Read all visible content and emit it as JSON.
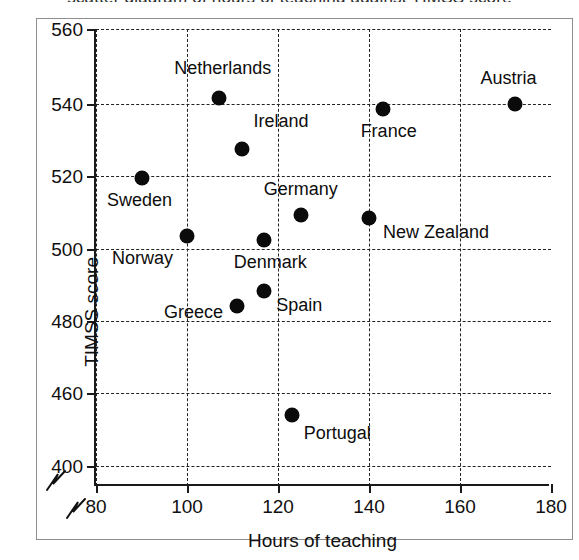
{
  "figure": {
    "title_remnant": "scatter diagram of hours of teaching against TIMSS score",
    "background_color": "#ffffff",
    "frame_color": "#8d8d8d",
    "axis_color": "#1a1a1a",
    "marker_color": "#0b0b0b"
  },
  "chart_data": {
    "type": "scatter",
    "title": "",
    "xlabel": "Hours of teaching",
    "ylabel": "TIMSS score",
    "xlim": [
      80,
      180
    ],
    "ylim": [
      400,
      560
    ],
    "grid": true,
    "legend": "none",
    "x_ticks": [
      80,
      100,
      120,
      140,
      160,
      180
    ],
    "y_ticks": [
      400,
      460,
      480,
      500,
      520,
      540,
      560
    ],
    "y_axis_break": {
      "present": true,
      "between": [
        400,
        460
      ],
      "note": "axis broken below 460; 400 shown at the base"
    },
    "x_axis_break": {
      "present": true,
      "note": "zig-zag break mark left of 80"
    },
    "points": [
      {
        "label": "Netherlands",
        "x": 107,
        "y": 541
      },
      {
        "label": "Ireland",
        "x": 112,
        "y": 527
      },
      {
        "label": "Sweden",
        "x": 90,
        "y": 519
      },
      {
        "label": "Germany",
        "x": 125,
        "y": 509
      },
      {
        "label": "New Zealand",
        "x": 140,
        "y": 508
      },
      {
        "label": "Norway",
        "x": 100,
        "y": 503
      },
      {
        "label": "Denmark",
        "x": 117,
        "y": 502
      },
      {
        "label": "Spain",
        "x": 117,
        "y": 488
      },
      {
        "label": "Greece",
        "x": 111,
        "y": 484
      },
      {
        "label": "Portugal",
        "x": 123,
        "y": 454
      },
      {
        "label": "France",
        "x": 143,
        "y": 538
      },
      {
        "label": "Austria",
        "x": 172,
        "y": 540
      }
    ]
  },
  "axis_labels": {
    "x": [
      "80",
      "100",
      "120",
      "140",
      "160",
      "180"
    ],
    "y": [
      "560",
      "540",
      "520",
      "500",
      "480",
      "460",
      "400"
    ]
  }
}
